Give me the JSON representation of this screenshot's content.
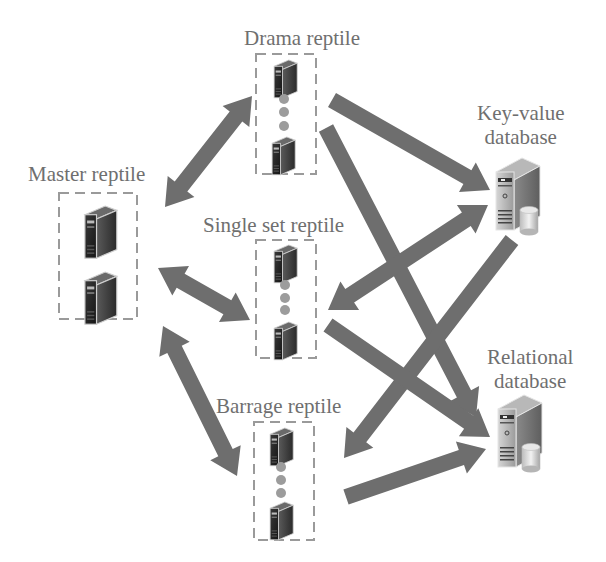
{
  "nodes": {
    "master": {
      "label": "Master reptile",
      "servers": 2
    },
    "drama": {
      "label": "Drama reptile",
      "servers": 2,
      "ellipsis_dots": 3
    },
    "single_set": {
      "label": "Single set reptile",
      "servers": 2,
      "ellipsis_dots": 3
    },
    "barrage": {
      "label": "Barrage reptile",
      "servers": 2,
      "ellipsis_dots": 3
    },
    "key_value_db": {
      "label_line1": "Key-value",
      "label_line2": "database",
      "icon": "database-server-icon"
    },
    "relational_db": {
      "label_line1": "Relational",
      "label_line2": "database",
      "icon": "database-server-icon"
    }
  },
  "edges": [
    {
      "from": "master",
      "to": "drama",
      "direction": "both"
    },
    {
      "from": "master",
      "to": "single_set",
      "direction": "both"
    },
    {
      "from": "master",
      "to": "barrage",
      "direction": "both"
    },
    {
      "from": "drama",
      "to": "key_value_db",
      "direction": "forward"
    },
    {
      "from": "drama",
      "to": "relational_db",
      "direction": "forward"
    },
    {
      "from": "key_value_db",
      "to": "single_set",
      "direction": "both"
    },
    {
      "from": "key_value_db",
      "to": "barrage",
      "direction": "forward"
    },
    {
      "from": "single_set",
      "to": "relational_db",
      "direction": "forward"
    },
    {
      "from": "barrage",
      "to": "relational_db",
      "direction": "forward"
    }
  ],
  "colors": {
    "arrow": "#6e6e6e",
    "label": "#6f6f6f",
    "box_border": "#9a9a9a",
    "dot": "#9c9c9c"
  }
}
